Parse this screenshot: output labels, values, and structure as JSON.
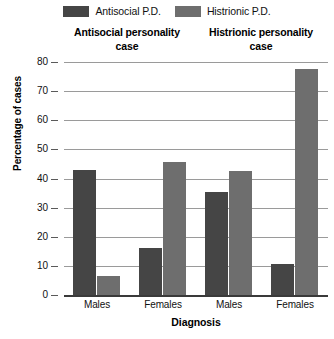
{
  "chart_data": {
    "type": "bar",
    "title": "",
    "xlabel": "Diagnosis",
    "ylabel": "Percentage of cases",
    "ylim": [
      0,
      80
    ],
    "yticks": [
      0,
      10,
      20,
      30,
      40,
      50,
      60,
      70,
      80
    ],
    "grid": true,
    "legend_position": "top-center",
    "groups": [
      {
        "title_line1": "Antisocial personality",
        "title_line2": "case"
      },
      {
        "title_line1": "Histrionic personality",
        "title_line2": "case"
      }
    ],
    "categories": [
      "Males",
      "Females",
      "Males",
      "Females"
    ],
    "series": [
      {
        "name": "Antisocial P.D.",
        "color": "#454545",
        "values": [
          43,
          16,
          35.5,
          10.5
        ]
      },
      {
        "name": "Histrionic P.D.",
        "color": "#6e6e6e",
        "values": [
          6.5,
          45.5,
          42.5,
          77.5
        ]
      }
    ],
    "bars": [
      {
        "group": "Antisocial personality case",
        "category": "Males",
        "series": "Antisocial P.D.",
        "value": 43,
        "color": "#454545"
      },
      {
        "group": "Antisocial personality case",
        "category": "Males",
        "series": "Histrionic P.D.",
        "value": 6.5,
        "color": "#6e6e6e"
      },
      {
        "group": "Antisocial personality case",
        "category": "Females",
        "series": "Antisocial P.D.",
        "value": 16,
        "color": "#454545"
      },
      {
        "group": "Antisocial personality case",
        "category": "Females",
        "series": "Histrionic P.D.",
        "value": 45.5,
        "color": "#6e6e6e"
      },
      {
        "group": "Histrionic personality case",
        "category": "Males",
        "series": "Antisocial P.D.",
        "value": 35.5,
        "color": "#454545"
      },
      {
        "group": "Histrionic personality case",
        "category": "Males",
        "series": "Histrionic P.D.",
        "value": 42.5,
        "color": "#6e6e6e"
      },
      {
        "group": "Histrionic personality case",
        "category": "Females",
        "series": "Antisocial P.D.",
        "value": 10.5,
        "color": "#454545"
      },
      {
        "group": "Histrionic personality case",
        "category": "Females",
        "series": "Histrionic P.D.",
        "value": 77.5,
        "color": "#6e6e6e"
      }
    ]
  },
  "legend": {
    "items": [
      {
        "label": "Antisocial P.D.",
        "color": "#454545"
      },
      {
        "label": "Histrionic P.D.",
        "color": "#6e6e6e"
      }
    ]
  },
  "group_titles": [
    {
      "line1": "Antisocial personality",
      "line2": "case"
    },
    {
      "line1": "Histrionic personality",
      "line2": "case"
    }
  ],
  "axes": {
    "y_title": "Percentage of cases",
    "x_title": "Diagnosis",
    "y_ticks": [
      "80",
      "70",
      "60",
      "50",
      "40",
      "30",
      "20",
      "10",
      "0"
    ],
    "x_ticks": [
      "Males",
      "Females",
      "Males",
      "Females"
    ]
  },
  "colors": {
    "antisocial": "#454545",
    "histrionic": "#6e6e6e",
    "gridline": "#9a9a9a",
    "axis": "#3a3a3a",
    "background": "#ffffff"
  }
}
